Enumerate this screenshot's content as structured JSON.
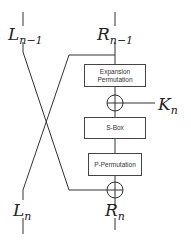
{
  "diagram": {
    "labels": {
      "l_in_main": "L",
      "l_in_sub": "n−1",
      "r_in_main": "R",
      "r_in_sub": "n−1",
      "key_main": "K",
      "key_sub": "n",
      "l_out_main": "L",
      "l_out_sub": "n",
      "r_out_main": "R",
      "r_out_sub": "n"
    },
    "boxes": {
      "expansion_line1": "Expansion",
      "expansion_line2": "Permutation",
      "sbox": "S-Box",
      "pperm": "P-Permutation"
    }
  }
}
